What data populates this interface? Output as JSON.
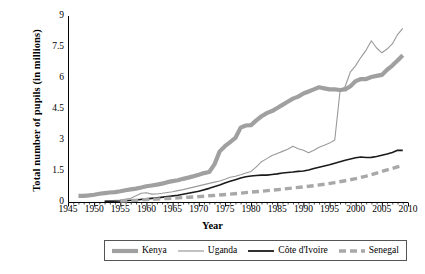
{
  "chart_data": {
    "type": "line",
    "title": "",
    "xlabel": "Year",
    "ylabel": "Total number of pupils (in millions)",
    "xlim": [
      1945,
      2010
    ],
    "ylim": [
      0,
      9
    ],
    "xticks": [
      1945,
      1950,
      1955,
      1960,
      1965,
      1970,
      1975,
      1980,
      1985,
      1990,
      1995,
      2000,
      2005,
      2010
    ],
    "yticks": [
      0,
      1.5,
      3,
      4.5,
      6,
      7.5,
      9
    ],
    "ytick_labels": [
      "0",
      "1.5",
      "3",
      "4.5",
      "6",
      "7.5",
      "9"
    ],
    "grid": false,
    "legend_position": "bottom",
    "series": [
      {
        "name": "Kenya",
        "color": "#a0a0a0",
        "style": "solid-thick",
        "width": 4.2,
        "points": [
          [
            1947,
            0.3
          ],
          [
            1948,
            0.3
          ],
          [
            1949,
            0.32
          ],
          [
            1950,
            0.35
          ],
          [
            1951,
            0.4
          ],
          [
            1952,
            0.43
          ],
          [
            1953,
            0.46
          ],
          [
            1954,
            0.48
          ],
          [
            1955,
            0.52
          ],
          [
            1956,
            0.57
          ],
          [
            1957,
            0.61
          ],
          [
            1958,
            0.65
          ],
          [
            1959,
            0.7
          ],
          [
            1960,
            0.76
          ],
          [
            1961,
            0.8
          ],
          [
            1962,
            0.84
          ],
          [
            1963,
            0.89
          ],
          [
            1964,
            0.96
          ],
          [
            1965,
            1.01
          ],
          [
            1966,
            1.05
          ],
          [
            1967,
            1.12
          ],
          [
            1968,
            1.18
          ],
          [
            1969,
            1.25
          ],
          [
            1970,
            1.32
          ],
          [
            1971,
            1.4
          ],
          [
            1972,
            1.45
          ],
          [
            1973,
            1.82
          ],
          [
            1974,
            2.45
          ],
          [
            1975,
            2.7
          ],
          [
            1976,
            2.9
          ],
          [
            1977,
            3.1
          ],
          [
            1978,
            3.6
          ],
          [
            1979,
            3.7
          ],
          [
            1980,
            3.72
          ],
          [
            1981,
            3.95
          ],
          [
            1982,
            4.15
          ],
          [
            1983,
            4.3
          ],
          [
            1984,
            4.4
          ],
          [
            1985,
            4.55
          ],
          [
            1986,
            4.7
          ],
          [
            1987,
            4.85
          ],
          [
            1988,
            5.0
          ],
          [
            1989,
            5.1
          ],
          [
            1990,
            5.25
          ],
          [
            1991,
            5.35
          ],
          [
            1992,
            5.45
          ],
          [
            1993,
            5.55
          ],
          [
            1994,
            5.5
          ],
          [
            1995,
            5.45
          ],
          [
            1996,
            5.45
          ],
          [
            1997,
            5.42
          ],
          [
            1998,
            5.45
          ],
          [
            1999,
            5.6
          ],
          [
            2000,
            5.85
          ],
          [
            2001,
            5.95
          ],
          [
            2002,
            5.95
          ],
          [
            2003,
            6.05
          ],
          [
            2004,
            6.1
          ],
          [
            2005,
            6.15
          ],
          [
            2006,
            6.4
          ],
          [
            2007,
            6.6
          ],
          [
            2008,
            6.85
          ],
          [
            2009,
            7.1
          ]
        ]
      },
      {
        "name": "Uganda",
        "color": "#9a9a9a",
        "style": "solid-thin",
        "width": 1.1,
        "points": [
          [
            1952,
            0.05
          ],
          [
            1955,
            0.1
          ],
          [
            1957,
            0.18
          ],
          [
            1958,
            0.3
          ],
          [
            1959,
            0.42
          ],
          [
            1960,
            0.45
          ],
          [
            1961,
            0.38
          ],
          [
            1962,
            0.39
          ],
          [
            1963,
            0.42
          ],
          [
            1964,
            0.46
          ],
          [
            1965,
            0.5
          ],
          [
            1966,
            0.55
          ],
          [
            1967,
            0.6
          ],
          [
            1968,
            0.66
          ],
          [
            1969,
            0.72
          ],
          [
            1970,
            0.78
          ],
          [
            1971,
            0.84
          ],
          [
            1972,
            0.9
          ],
          [
            1973,
            0.96
          ],
          [
            1974,
            1.02
          ],
          [
            1975,
            1.1
          ],
          [
            1976,
            1.2
          ],
          [
            1977,
            1.25
          ],
          [
            1978,
            1.32
          ],
          [
            1979,
            1.4
          ],
          [
            1980,
            1.48
          ],
          [
            1981,
            1.7
          ],
          [
            1982,
            1.95
          ],
          [
            1983,
            2.1
          ],
          [
            1984,
            2.25
          ],
          [
            1985,
            2.35
          ],
          [
            1986,
            2.45
          ],
          [
            1987,
            2.55
          ],
          [
            1988,
            2.7
          ],
          [
            1989,
            2.58
          ],
          [
            1990,
            2.5
          ],
          [
            1991,
            2.38
          ],
          [
            1992,
            2.5
          ],
          [
            1993,
            2.65
          ],
          [
            1994,
            2.75
          ],
          [
            1995,
            2.85
          ],
          [
            1996,
            3.0
          ],
          [
            1997,
            5.35
          ],
          [
            1998,
            5.6
          ],
          [
            1999,
            6.3
          ],
          [
            2000,
            6.6
          ],
          [
            2001,
            7.0
          ],
          [
            2002,
            7.35
          ],
          [
            2003,
            7.8
          ],
          [
            2004,
            7.45
          ],
          [
            2005,
            7.22
          ],
          [
            2006,
            7.4
          ],
          [
            2007,
            7.65
          ],
          [
            2008,
            8.1
          ],
          [
            2009,
            8.4
          ]
        ]
      },
      {
        "name": "Côte d'Ivoire",
        "color": "#1a1a1a",
        "style": "solid-thin",
        "width": 1.6,
        "points": [
          [
            1952,
            0.03
          ],
          [
            1955,
            0.05
          ],
          [
            1958,
            0.1
          ],
          [
            1960,
            0.15
          ],
          [
            1962,
            0.2
          ],
          [
            1964,
            0.26
          ],
          [
            1966,
            0.33
          ],
          [
            1968,
            0.42
          ],
          [
            1970,
            0.52
          ],
          [
            1972,
            0.66
          ],
          [
            1974,
            0.82
          ],
          [
            1975,
            0.92
          ],
          [
            1976,
            1.0
          ],
          [
            1977,
            1.08
          ],
          [
            1978,
            1.16
          ],
          [
            1979,
            1.22
          ],
          [
            1980,
            1.26
          ],
          [
            1981,
            1.28
          ],
          [
            1982,
            1.3
          ],
          [
            1983,
            1.3
          ],
          [
            1984,
            1.33
          ],
          [
            1985,
            1.36
          ],
          [
            1986,
            1.4
          ],
          [
            1987,
            1.43
          ],
          [
            1988,
            1.45
          ],
          [
            1989,
            1.48
          ],
          [
            1990,
            1.5
          ],
          [
            1991,
            1.55
          ],
          [
            1992,
            1.62
          ],
          [
            1993,
            1.68
          ],
          [
            1994,
            1.74
          ],
          [
            1995,
            1.8
          ],
          [
            1996,
            1.88
          ],
          [
            1997,
            1.95
          ],
          [
            1998,
            2.02
          ],
          [
            1999,
            2.08
          ],
          [
            2000,
            2.14
          ],
          [
            2001,
            2.18
          ],
          [
            2002,
            2.15
          ],
          [
            2003,
            2.16
          ],
          [
            2004,
            2.2
          ],
          [
            2005,
            2.26
          ],
          [
            2006,
            2.32
          ],
          [
            2007,
            2.4
          ],
          [
            2008,
            2.5
          ],
          [
            2009,
            2.5
          ]
        ]
      },
      {
        "name": "Senegal",
        "color": "#a8a8a8",
        "style": "dashed",
        "width": 3.4,
        "points": [
          [
            1955,
            0.05
          ],
          [
            1958,
            0.08
          ],
          [
            1960,
            0.12
          ],
          [
            1962,
            0.14
          ],
          [
            1964,
            0.17
          ],
          [
            1966,
            0.2
          ],
          [
            1968,
            0.23
          ],
          [
            1970,
            0.26
          ],
          [
            1972,
            0.3
          ],
          [
            1974,
            0.34
          ],
          [
            1976,
            0.38
          ],
          [
            1978,
            0.43
          ],
          [
            1980,
            0.48
          ],
          [
            1982,
            0.52
          ],
          [
            1984,
            0.57
          ],
          [
            1986,
            0.62
          ],
          [
            1988,
            0.68
          ],
          [
            1990,
            0.73
          ],
          [
            1992,
            0.79
          ],
          [
            1994,
            0.86
          ],
          [
            1996,
            0.94
          ],
          [
            1998,
            1.03
          ],
          [
            2000,
            1.13
          ],
          [
            2002,
            1.25
          ],
          [
            2004,
            1.4
          ],
          [
            2006,
            1.55
          ],
          [
            2008,
            1.7
          ],
          [
            2009,
            1.76
          ]
        ]
      }
    ],
    "legend": [
      {
        "label": "Kenya",
        "color": "#a0a0a0",
        "style": "solid-thick"
      },
      {
        "label": "Uganda",
        "color": "#9a9a9a",
        "style": "solid-thin"
      },
      {
        "label": "Côte d'Ivoire",
        "color": "#1a1a1a",
        "style": "solid-thin"
      },
      {
        "label": "Senegal",
        "color": "#a8a8a8",
        "style": "dashed"
      }
    ],
    "axis_color": "#000000"
  }
}
